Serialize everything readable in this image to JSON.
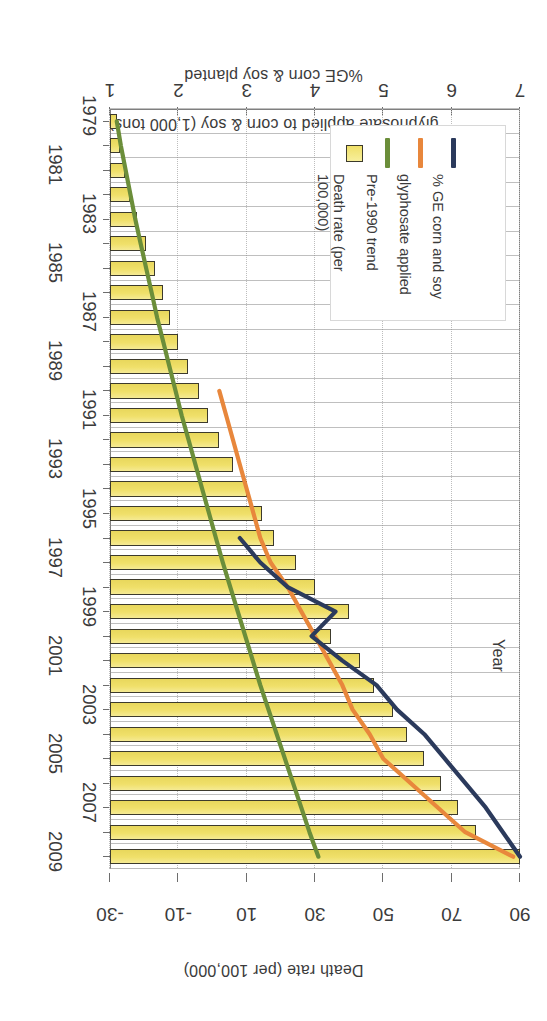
{
  "chart_data": {
    "type": "bar",
    "title": "",
    "orientation": "horizontal-printed-upside-down",
    "xlabel": "Year",
    "ylabel": "Death rate (per 100,000)",
    "y2label_line1": "glyphosate applied to corn & soy (1,000 tons)",
    "y2label_line2": "%GE corn & soy planted",
    "ylim": [
      1,
      7
    ],
    "yticks": [
      7,
      6,
      5,
      4,
      3,
      2,
      1
    ],
    "y2lim": [
      -30,
      90
    ],
    "y2ticks": [
      90,
      70,
      50,
      30,
      10,
      -10,
      -30
    ],
    "grid": true,
    "legend_position": "inside-lower-left",
    "categories": [
      "1979",
      "1980",
      "1981",
      "1982",
      "1983",
      "1984",
      "1985",
      "1986",
      "1987",
      "1988",
      "1989",
      "1990",
      "1991",
      "1992",
      "1993",
      "1994",
      "1995",
      "1996",
      "1997",
      "1998",
      "1999",
      "2000",
      "2001",
      "2002",
      "2003",
      "2004",
      "2005",
      "2006",
      "2007",
      "2008",
      "2009"
    ],
    "year_tick_labels": [
      "1979",
      "1981",
      "1983",
      "1985",
      "1987",
      "1989",
      "1991",
      "1993",
      "1995",
      "1997",
      "1999",
      "2001",
      "2003",
      "2005",
      "2007",
      "2009"
    ],
    "series": [
      {
        "name": "Death rate (per 100,000)",
        "kind": "bar",
        "axis": "primary",
        "color": "#f0e06a",
        "border_color": "#3c3a2c",
        "values": [
          1.1,
          1.15,
          1.22,
          1.3,
          1.4,
          1.52,
          1.66,
          1.78,
          1.88,
          2.0,
          2.14,
          2.3,
          2.44,
          2.6,
          2.8,
          3.0,
          3.22,
          3.4,
          3.72,
          4.0,
          4.5,
          4.24,
          4.66,
          4.86,
          5.14,
          5.34,
          5.6,
          5.84,
          6.1,
          6.36,
          7.0
        ]
      },
      {
        "name": "Pre-1990 trend",
        "kind": "line",
        "axis": "primary",
        "color": "#6b8e3a",
        "values": [
          1.1,
          1.16,
          1.23,
          1.3,
          1.37,
          1.45,
          1.53,
          1.61,
          1.69,
          1.78,
          1.87,
          1.96,
          2.05,
          2.15,
          2.25,
          2.35,
          2.45,
          2.55,
          2.65,
          2.76,
          2.87,
          2.98,
          3.09,
          3.2,
          3.32,
          3.44,
          3.56,
          3.68,
          3.8,
          3.92,
          4.05
        ]
      },
      {
        "name": "glyphosate applied",
        "kind": "line",
        "axis": "secondary",
        "color": "#e8873c",
        "values": [
          null,
          null,
          null,
          null,
          null,
          null,
          null,
          null,
          null,
          null,
          null,
          2,
          4,
          6,
          8,
          10,
          12,
          14,
          17,
          22,
          26,
          30,
          34,
          38,
          41,
          46,
          50,
          58,
          66,
          74,
          88
        ]
      },
      {
        "name": "% GE corn and soy",
        "kind": "line",
        "axis": "secondary",
        "color": "#2b3a5c",
        "values": [
          null,
          null,
          null,
          null,
          null,
          null,
          null,
          null,
          null,
          null,
          null,
          null,
          null,
          null,
          null,
          null,
          null,
          8,
          14,
          22,
          36,
          29,
          38,
          48,
          54,
          62,
          68,
          74,
          80,
          85,
          90
        ]
      }
    ],
    "colors": {
      "bar_fill": "#f0e06a",
      "bar_border": "#3c3a2c",
      "pre1990_trend": "#6b8e3a",
      "glyphosate": "#e8873c",
      "ge_corn_soy": "#2b3a5c",
      "text": "#3b3b3b",
      "grid": "#8a8a8a",
      "background": "#ffffff"
    }
  },
  "axes": {
    "primary_title": "Death rate (per 100,000)",
    "secondary_title_line1": "glyphosate applied to corn & soy (1,000 tons)",
    "secondary_title_line2": "%GE corn & soy planted",
    "category_title": "Year"
  },
  "legend": {
    "items": [
      {
        "label": "Death rate (per\n100,000)",
        "marker": "box",
        "color": "#f0e06a"
      },
      {
        "label": "Pre-1990 trend",
        "marker": "line",
        "color": "#6b8e3a"
      },
      {
        "label": "glyphosate applied",
        "marker": "line",
        "color": "#e8873c"
      },
      {
        "label": "% GE corn and soy",
        "marker": "line",
        "color": "#2b3a5c"
      }
    ]
  }
}
